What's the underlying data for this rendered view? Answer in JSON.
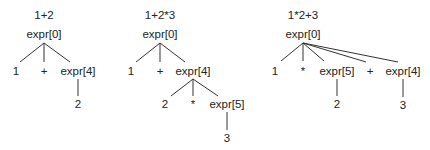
{
  "trees": [
    {
      "title": "1+2",
      "root": "expr[0]",
      "children": [
        "1",
        "+",
        "expr[4]"
      ],
      "grandchildren": [
        "2"
      ]
    },
    {
      "title": "1+2*3",
      "root": "expr[0]",
      "children": [
        "1",
        "+",
        "expr[4]"
      ],
      "grandchildren": [
        "2",
        "*",
        "expr[5]"
      ],
      "leaf": "3"
    },
    {
      "title": "1*2+3",
      "root": "expr[0]",
      "children": [
        "1",
        "*",
        "expr[5]",
        "+",
        "expr[4]"
      ],
      "grandchildren": [
        "2",
        "3"
      ]
    }
  ]
}
